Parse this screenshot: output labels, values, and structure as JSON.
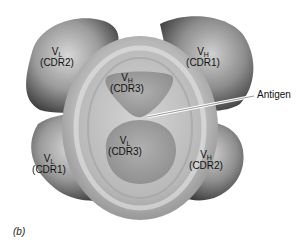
{
  "figure": {
    "panel_label": "(b)",
    "antigen_label": "Antigen",
    "regions": [
      {
        "id": "vl-cdr2",
        "domain": "V",
        "subscript": "L",
        "loop": "(CDR2)",
        "position": "top-left"
      },
      {
        "id": "vh-cdr1",
        "domain": "V",
        "subscript": "H",
        "loop": "(CDR1)",
        "position": "top-right"
      },
      {
        "id": "vh-cdr3",
        "domain": "V",
        "subscript": "H",
        "loop": "(CDR3)",
        "position": "center-top"
      },
      {
        "id": "vl-cdr3",
        "domain": "V",
        "subscript": "L",
        "loop": "(CDR3)",
        "position": "center-bottom"
      },
      {
        "id": "vl-cdr1",
        "domain": "V",
        "subscript": "L",
        "loop": "(CDR1)",
        "position": "bottom-left"
      },
      {
        "id": "vh-cdr2",
        "domain": "V",
        "subscript": "H",
        "loop": "(CDR2)",
        "position": "bottom-right"
      }
    ],
    "colors": {
      "lobe_dark": "#3a3a3a",
      "lobe_mid": "#8a8a8a",
      "lobe_light": "#d6d6d6",
      "center_light": "#c8c8c8",
      "background": "#ffffff"
    }
  }
}
